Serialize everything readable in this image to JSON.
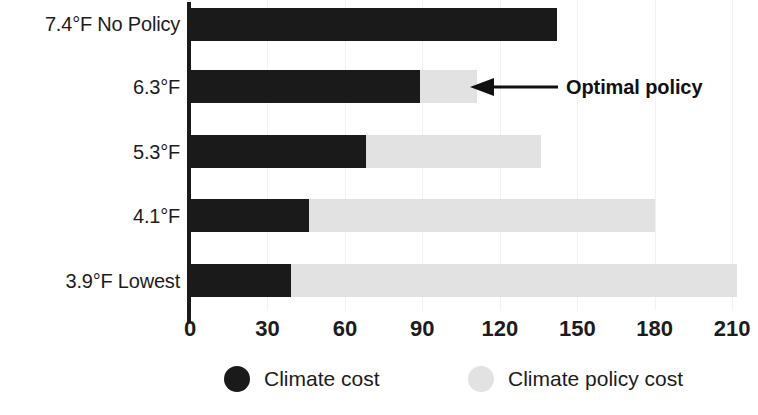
{
  "chart_data": {
    "type": "bar",
    "orientation": "horizontal",
    "stacked": true,
    "title": "",
    "subtitle": "",
    "xlabel": "",
    "ylabel": "",
    "xlim": [
      0,
      220
    ],
    "xticks": [
      0,
      30,
      60,
      90,
      120,
      150,
      180,
      210
    ],
    "xtick_labels": [
      "0",
      "30",
      "60",
      "90",
      "120",
      "150",
      "180",
      "210"
    ],
    "grid": true,
    "grid_axis": "x",
    "legend_position": "bottom",
    "categories": [
      "7.4°F No Policy",
      "6.3°F",
      "5.3°F",
      "4.1°F",
      "3.9°F Lowest"
    ],
    "series": [
      {
        "name": "Climate cost",
        "color": "#1a1a1a",
        "values": [
          142,
          89,
          68,
          46,
          39
        ]
      },
      {
        "name": "Climate policy cost",
        "color": "#e2e2e2",
        "values": [
          0,
          22,
          68,
          134,
          173
        ]
      }
    ],
    "totals": [
      142,
      111,
      136,
      180,
      212
    ],
    "annotations": [
      {
        "text": "Optimal policy",
        "target_category": "6.3°F",
        "arrow": "left-arrow-icon"
      }
    ]
  },
  "legend": {
    "items": [
      {
        "label": "Climate cost",
        "color": "#1a1a1a",
        "swatch": "filled-circle-dark"
      },
      {
        "label": "Climate policy cost",
        "color": "#e2e2e2",
        "swatch": "filled-circle-light"
      }
    ]
  }
}
